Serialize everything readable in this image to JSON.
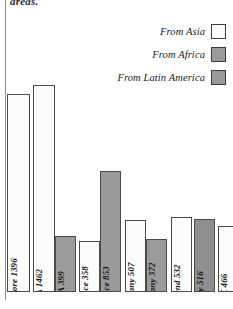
{
  "page": {
    "top_text_fragment": "areas."
  },
  "legend": {
    "position": "top-right",
    "items": [
      {
        "label": "From Asia",
        "color": "#fbfbf9",
        "key": "asia"
      },
      {
        "label": "From Africa",
        "color": "#9b9b9b",
        "key": "africa"
      },
      {
        "label": "From Latin America",
        "color": "#9a9a9a",
        "key": "latin_america"
      }
    ]
  },
  "chart_data": {
    "type": "bar",
    "title": "",
    "subtitle": "",
    "xlabel": "",
    "ylabel": "",
    "grid": false,
    "legend_position": "top-right",
    "ylim": [
      0,
      1600
    ],
    "categories": [
      "Singapore 1396",
      "USA 1462",
      "USA 399",
      "France 358",
      "France 853",
      "Germany 507",
      "Germany 372",
      "Holland 532",
      "Italy 516",
      "UK 466"
    ],
    "values": [
      1396,
      1462,
      399,
      358,
      853,
      507,
      372,
      532,
      516,
      466
    ],
    "series": [
      {
        "name": "From Asia",
        "color": "#fbfbf9"
      },
      {
        "name": "From Africa",
        "color": "#9b9b9b"
      },
      {
        "name": "From Latin America",
        "color": "#9a9a9a"
      }
    ],
    "bars": [
      {
        "label": "Singapore 1396",
        "country": "Singapore",
        "value": 1396,
        "series": "From Asia",
        "color": "#fbfbf9",
        "x": 7,
        "w": 23
      },
      {
        "label": "USA 1462",
        "country": "USA",
        "value": 1462,
        "series": "From Asia",
        "color": "#fcfcfa",
        "x": 33,
        "w": 22
      },
      {
        "label": "USA 399",
        "country": "USA",
        "value": 399,
        "series": "From Africa",
        "color": "#9b9b9b",
        "x": 55,
        "w": 21
      },
      {
        "label": "France 358",
        "country": "France",
        "value": 358,
        "series": "From Asia",
        "color": "#fcfcfa",
        "x": 79,
        "w": 21
      },
      {
        "label": "France 853",
        "country": "France",
        "value": 853,
        "series": "From Latin America",
        "color": "#9a9a9a",
        "x": 100,
        "w": 21
      },
      {
        "label": "Germany 507",
        "country": "Germany",
        "value": 507,
        "series": "From Asia",
        "color": "#fcfcfa",
        "x": 125,
        "w": 21
      },
      {
        "label": "Germany 372",
        "country": "Germany",
        "value": 372,
        "series": "From Africa",
        "color": "#9b9b9b",
        "x": 146,
        "w": 21
      },
      {
        "label": "Holland 532",
        "country": "Holland",
        "value": 532,
        "series": "From Asia",
        "color": "#fcfcfa",
        "x": 171,
        "w": 21
      },
      {
        "label": "Italy 516",
        "country": "Italy",
        "value": 516,
        "series": "From Latin America",
        "color": "#8f8f8f",
        "x": 194,
        "w": 21
      },
      {
        "label": "UK 466",
        "country": "UK",
        "value": 466,
        "series": "From Asia",
        "color": "#fcfcfa",
        "x": 218,
        "w": 21
      }
    ]
  }
}
